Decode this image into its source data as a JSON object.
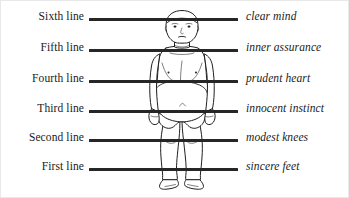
{
  "diagram": {
    "figure_name": "standing-human-figure",
    "line_color": "#262626",
    "text_color": "#1a1a1a",
    "background": "#ffffff",
    "rows": [
      {
        "left_label": "Sixth line",
        "right_label": "clear mind",
        "level": 6
      },
      {
        "left_label": "Fifth line",
        "right_label": "inner assurance",
        "level": 5
      },
      {
        "left_label": "Fourth line",
        "right_label": "prudent heart",
        "level": 4
      },
      {
        "left_label": "Third line",
        "right_label": "innocent instinct",
        "level": 3
      },
      {
        "left_label": "Second line",
        "right_label": "modest knees",
        "level": 2
      },
      {
        "left_label": "First line",
        "right_label": "sincere feet",
        "level": 1
      }
    ]
  }
}
